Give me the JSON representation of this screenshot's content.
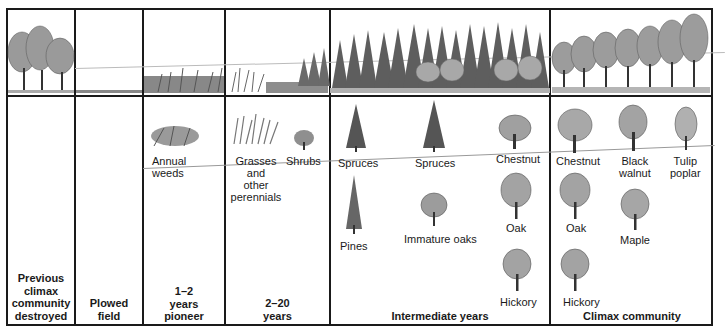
{
  "figure": {
    "stages": [
      {
        "label": "Previous climax community destroyed",
        "lines": [
          "Previous",
          "climax",
          "community",
          "destroyed"
        ]
      },
      {
        "label": "Plowed field",
        "lines": [
          "Plowed",
          "field"
        ]
      },
      {
        "label": "1–2 years pioneer",
        "lines": [
          "1–2",
          "years",
          "pioneer"
        ]
      },
      {
        "label": "2–20 years",
        "lines": [
          "2–20",
          "years"
        ]
      },
      {
        "label": "Intermediate years",
        "lines": [
          "Intermediate years"
        ]
      },
      {
        "label": "Climax community",
        "lines": [
          "Climax community"
        ]
      }
    ],
    "species": {
      "pioneer": [
        "Annual",
        "weeds"
      ],
      "grasses": [
        "Grasses",
        "and",
        "other",
        "perennials"
      ],
      "shrubs": "Shrubs",
      "intermediate": {
        "spruces1": "Spruces",
        "spruces2": "Spruces",
        "chestnut": "Chestnut",
        "pines": "Pines",
        "immature_oaks": "Immature oaks",
        "oak": "Oak",
        "hickory": "Hickory"
      },
      "climax": {
        "chestnut": "Chestnut",
        "black_walnut": [
          "Black",
          "walnut"
        ],
        "tulip_poplar": [
          "Tulip",
          "poplar"
        ],
        "oak": "Oak",
        "maple": "Maple",
        "hickory": "Hickory"
      }
    },
    "colors": {
      "line": "#1a1a1a",
      "sketch": "#555555",
      "foliage": "#8a8a8a"
    }
  }
}
